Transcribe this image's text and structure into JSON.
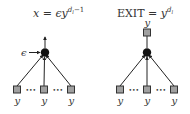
{
  "left_diagram": {
    "title": {
      "lhs": "x",
      "eq": " = ",
      "eps": "ϵ",
      "base": "y",
      "exp": "d",
      "exp_sub": "l",
      "exp_tail": "−1"
    },
    "input_label": "ϵ",
    "leaf_labels": [
      "y",
      "y",
      "y"
    ],
    "ellipsis": "•••"
  },
  "right_diagram": {
    "title": {
      "lhs": "EXIT",
      "eq": " = ",
      "base": "y",
      "exp": "d",
      "exp_sub": "l"
    },
    "output_label": "y",
    "leaf_labels": [
      "y",
      "y",
      "y"
    ],
    "ellipsis": "•••"
  },
  "colors": {
    "node_fill": "#111111",
    "square_fill": "#a0a0a0",
    "square_stroke": "#333333",
    "edge": "#222222",
    "text": "#333333"
  }
}
